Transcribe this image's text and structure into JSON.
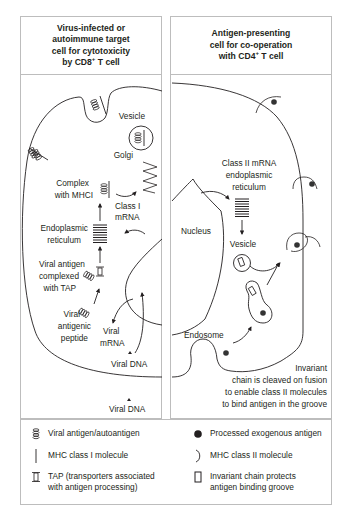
{
  "panels": {
    "left": {
      "title_lines": [
        "Virus-infected or",
        "autoimmune target",
        "cell for cytotoxicity",
        "by CD8"
      ],
      "title_sup": "+",
      "title_suffix": " T cell",
      "labels": {
        "vesicle": "Vesicle",
        "golgi": "Golgi",
        "complex_1": "Complex",
        "complex_2": "with MHCI",
        "class1_mrna_1": "Class I",
        "class1_mrna_2": "mRNA",
        "er_1": "Endoplasmic",
        "er_2": "reticulum",
        "tap_1": "Viral antigen",
        "tap_2": "complexed",
        "tap_3": "with TAP",
        "peptide_1": "Viral",
        "peptide_2": "antigenic",
        "peptide_3": "peptide",
        "viral_mrna_1": "Viral",
        "viral_mrna_2": "mRNA",
        "viral_dna_inside": "Viral DNA",
        "viral_dna_outside": "Viral DNA"
      }
    },
    "right": {
      "title_lines": [
        "Antigen-presenting",
        "cell for co-operation",
        "with CD4"
      ],
      "title_sup": "+",
      "title_suffix": " T cell",
      "labels": {
        "class2_1": "Class II mRNA",
        "class2_2": "endoplasmic",
        "class2_3": "reticulum",
        "nucleus": "Nucleus",
        "vesicle": "Vesicle",
        "endosome": "Endosome",
        "invariant_1": "Invariant",
        "invariant_2": "chain is cleaved on fusion",
        "invariant_3": "to enable class II molecules",
        "invariant_4": "to bind antigen in the groove"
      }
    }
  },
  "legend": {
    "items": [
      {
        "icon": "coil-icon",
        "text": "Viral antigen/autoantigen"
      },
      {
        "icon": "dot-icon",
        "text": "Processed exogenous antigen"
      },
      {
        "icon": "bar-icon",
        "text": "MHC class I molecule"
      },
      {
        "icon": "bracket-icon",
        "text": "MHC class II molecule"
      },
      {
        "icon": "tap-icon",
        "text_1": "TAP (transporters associated",
        "text_2": "with antigen processing)"
      },
      {
        "icon": "rect-icon",
        "text_1": "Invariant chain protects",
        "text_2": "antigen binding groove"
      }
    ]
  },
  "colors": {
    "line": "#231f20",
    "border": "#bdbdbd",
    "antigen_dot": "#333333"
  }
}
